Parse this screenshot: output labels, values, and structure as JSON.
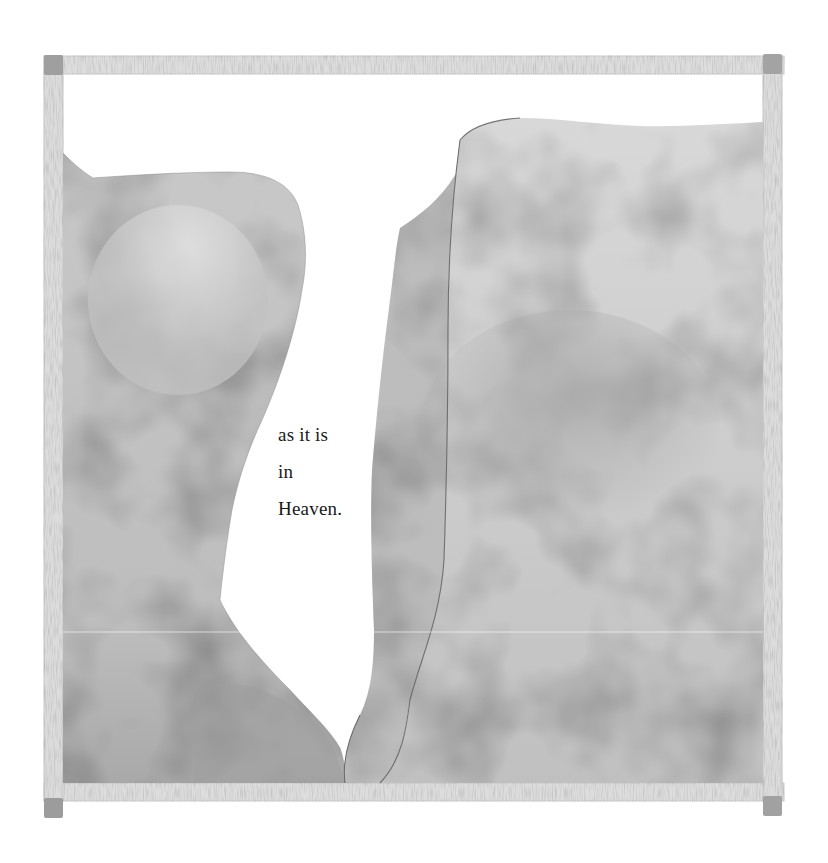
{
  "illustration": {
    "style": "watercolor",
    "background": "#ffffff",
    "frame": {
      "bar_color": "#dcdcdc",
      "bar_edge_color": "#c4c4c4",
      "corner_color": "#9e9e9e"
    },
    "shapes": {
      "left_rock_color": "#c6c6c6",
      "left_rock_dark": "#9a9a9a",
      "center_rock_color": "#b8b8b8",
      "right_rock_color": "#cfcfcf",
      "right_rock_shadow": "#a8a8a8",
      "outline_color": "#6e6e6e"
    }
  },
  "verse": {
    "lines": [
      "as it is",
      "in",
      "Heaven."
    ]
  }
}
